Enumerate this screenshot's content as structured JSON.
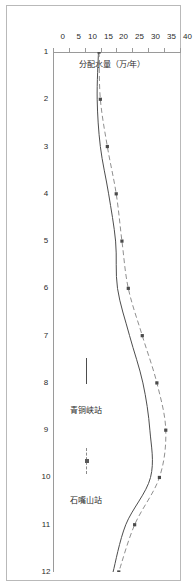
{
  "figure": {
    "background_color": "#ffffff",
    "frame_color": "#b9b9b9",
    "orientation_note": "chart rendered rotated 90 degrees within the page"
  },
  "chart_data": {
    "type": "line",
    "title": "",
    "xlabel": "",
    "ylabel": "分配水量（万/年）",
    "categories": [
      "1",
      "2",
      "3",
      "4",
      "5",
      "6",
      "7",
      "8",
      "9",
      "10",
      "11",
      "12"
    ],
    "x": [
      1,
      2,
      3,
      4,
      5,
      6,
      7,
      8,
      9,
      10,
      11,
      12
    ],
    "xlim": [
      1,
      12
    ],
    "ylim": [
      0,
      40
    ],
    "yticks": [
      0,
      5,
      10,
      15,
      20,
      25,
      30,
      35,
      40
    ],
    "xticks": [
      1,
      2,
      3,
      4,
      5,
      6,
      7,
      8,
      9,
      10,
      11,
      12
    ],
    "grid": false,
    "legend_position": "inside-lower-right",
    "series": [
      {
        "name": "青铜峡站",
        "style": "solid",
        "marker": "none",
        "color": "#4d4d4d",
        "values": [
          14.0,
          13.6,
          14.6,
          17.2,
          19.4,
          20.0,
          23.8,
          28.0,
          30.2,
          30.4,
          22.6,
          18.6
        ]
      },
      {
        "name": "石嘴山站",
        "style": "dashed",
        "marker": "square",
        "color": "#8f8f8f",
        "values": [
          14.2,
          14.6,
          16.8,
          19.6,
          21.4,
          23.4,
          27.8,
          32.4,
          35.2,
          33.2,
          25.4,
          20.4
        ]
      }
    ]
  },
  "axes": {
    "y_tick_labels": [
      "0",
      "5",
      "10",
      "15",
      "20",
      "25",
      "30",
      "35",
      "40"
    ],
    "x_tick_labels": [
      "1",
      "2",
      "3",
      "4",
      "5",
      "6",
      "7",
      "8",
      "9",
      "10",
      "11",
      "12"
    ],
    "y_axis_title": "分配水量（万/年）"
  },
  "legend": {
    "entries": [
      {
        "label": "青铜峡站",
        "style": "solid"
      },
      {
        "label": "石嘴山站",
        "style": "dashed-marker"
      }
    ]
  }
}
